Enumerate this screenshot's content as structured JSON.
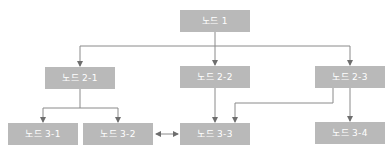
{
  "diagram": {
    "type": "tree-flowchart",
    "colors": {
      "node_fill": "#b9b9b9",
      "node_text": "#ffffff",
      "line": "#7a7a7a"
    },
    "nodes": [
      {
        "id": "n1",
        "label": "노드 1",
        "x": 180,
        "y": 10
      },
      {
        "id": "n21",
        "label": "노드 2-1",
        "x": 45,
        "y": 67
      },
      {
        "id": "n22",
        "label": "노드 2-2",
        "x": 180,
        "y": 66
      },
      {
        "id": "n23",
        "label": "노드 2-3",
        "x": 315,
        "y": 66
      },
      {
        "id": "n31",
        "label": "노드 3-1",
        "x": 8,
        "y": 123
      },
      {
        "id": "n32",
        "label": "노드 3-2",
        "x": 83,
        "y": 123
      },
      {
        "id": "n33",
        "label": "노드 3-3",
        "x": 180,
        "y": 123
      },
      {
        "id": "n34",
        "label": "노드 3-4",
        "x": 315,
        "y": 122
      }
    ],
    "edges": [
      {
        "from": "노드 1",
        "to": "노드 2-1",
        "type": "arrow"
      },
      {
        "from": "노드 1",
        "to": "노드 2-2",
        "type": "arrow"
      },
      {
        "from": "노드 1",
        "to": "노드 2-3",
        "type": "arrow"
      },
      {
        "from": "노드 2-1",
        "to": "노드 3-1",
        "type": "arrow"
      },
      {
        "from": "노드 2-1",
        "to": "노드 3-2",
        "type": "arrow"
      },
      {
        "from": "노드 2-2",
        "to": "노드 3-3",
        "type": "arrow"
      },
      {
        "from": "노드 2-3",
        "to": "노드 3-3",
        "type": "arrow"
      },
      {
        "from": "노드 2-3",
        "to": "노드 3-4",
        "type": "arrow"
      },
      {
        "from": "노드 3-2",
        "to": "노드 3-3",
        "type": "bidirectional"
      }
    ]
  }
}
